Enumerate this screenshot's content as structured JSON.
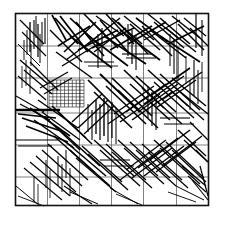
{
  "figure": {
    "type": "fracture-network-diagram",
    "width": 225,
    "height": 225,
    "background_color": "#ffffff"
  },
  "domain": {
    "name": "model-domain",
    "x0": 15.5,
    "y0": 13.5,
    "x1": 208.5,
    "y1": 205.5,
    "border_color": "#111111",
    "border_width": 1.6
  },
  "coarse_grid": {
    "name": "coarse-grid",
    "color": "#4a4a4a",
    "line_width": 0.7,
    "vertical_x": [
      47.5,
      79.5,
      111.5,
      143.5,
      176.5
    ],
    "horizontal_y": [
      46.0,
      78.0,
      113.0,
      145.0,
      177.0
    ],
    "columns": 6,
    "rows": 6
  },
  "refined_grid": {
    "name": "refined-subgrid",
    "color": "#1a1a1a",
    "line_width": 0.6,
    "x0": 49.0,
    "y0": 80.0,
    "x1": 84.0,
    "y1": 107.0,
    "cols": 9,
    "rows": 8
  },
  "fractures": {
    "name": "fracture-segments",
    "color": "#000000",
    "count": 196,
    "segments": [
      [
        30,
        22,
        30,
        52,
        1.3
      ],
      [
        34,
        20,
        34,
        49,
        1.1
      ],
      [
        38,
        24,
        38,
        57,
        1.2
      ],
      [
        42,
        22,
        42,
        46,
        1.0
      ],
      [
        27,
        30,
        27,
        55,
        1.0
      ],
      [
        45,
        18,
        45,
        44,
        1.1
      ],
      [
        24,
        40,
        24,
        60,
        0.9
      ],
      [
        36,
        16,
        36,
        38,
        1.0
      ],
      [
        40,
        34,
        40,
        63,
        1.0
      ],
      [
        31,
        44,
        31,
        66,
        0.9
      ],
      [
        52,
        15,
        66,
        40,
        1.6
      ],
      [
        55,
        18,
        78,
        44,
        1.7
      ],
      [
        60,
        16,
        88,
        52,
        1.8
      ],
      [
        50,
        30,
        82,
        62,
        1.5
      ],
      [
        58,
        46,
        90,
        26,
        1.6
      ],
      [
        64,
        52,
        96,
        22,
        1.5
      ],
      [
        70,
        18,
        100,
        46,
        1.7
      ],
      [
        76,
        22,
        104,
        56,
        1.6
      ],
      [
        66,
        60,
        98,
        36,
        1.4
      ],
      [
        84,
        14,
        110,
        40,
        1.5
      ],
      [
        90,
        20,
        118,
        48,
        1.6
      ],
      [
        96,
        16,
        124,
        36,
        1.4
      ],
      [
        88,
        44,
        120,
        18,
        1.5
      ],
      [
        94,
        52,
        126,
        28,
        1.4
      ],
      [
        100,
        20,
        128,
        52,
        1.6
      ],
      [
        106,
        14,
        134,
        44,
        1.5
      ],
      [
        112,
        18,
        142,
        44,
        1.6
      ],
      [
        118,
        22,
        148,
        54,
        1.5
      ],
      [
        124,
        16,
        154,
        40,
        1.4
      ],
      [
        130,
        24,
        160,
        50,
        1.5
      ],
      [
        136,
        18,
        168,
        42,
        1.6
      ],
      [
        142,
        26,
        172,
        56,
        1.5
      ],
      [
        148,
        14,
        178,
        38,
        1.4
      ],
      [
        154,
        22,
        184,
        48,
        1.5
      ],
      [
        160,
        18,
        190,
        44,
        1.6
      ],
      [
        166,
        28,
        196,
        52,
        1.4
      ],
      [
        172,
        16,
        200,
        38,
        1.5
      ],
      [
        178,
        24,
        204,
        50,
        1.4
      ],
      [
        184,
        18,
        206,
        36,
        1.3
      ],
      [
        190,
        28,
        208,
        46,
        1.2
      ],
      [
        196,
        14,
        196,
        48,
        1.2
      ],
      [
        202,
        20,
        202,
        56,
        1.1
      ],
      [
        160,
        36,
        200,
        62,
        1.7
      ],
      [
        168,
        44,
        204,
        26,
        1.6
      ],
      [
        150,
        30,
        186,
        58,
        1.5
      ],
      [
        144,
        40,
        180,
        20,
        1.4
      ],
      [
        120,
        30,
        160,
        60,
        1.8
      ],
      [
        128,
        44,
        166,
        22,
        1.6
      ],
      [
        104,
        36,
        146,
        64,
        1.7
      ],
      [
        110,
        50,
        152,
        26,
        1.5
      ],
      [
        86,
        34,
        128,
        66,
        1.6
      ],
      [
        92,
        48,
        134,
        28,
        1.4
      ],
      [
        70,
        36,
        112,
        68,
        1.7
      ],
      [
        78,
        50,
        118,
        30,
        1.5
      ],
      [
        56,
        52,
        92,
        78,
        1.5
      ],
      [
        62,
        66,
        98,
        44,
        1.4
      ],
      [
        20,
        60,
        48,
        84,
        1.4
      ],
      [
        24,
        70,
        52,
        94,
        1.3
      ],
      [
        18,
        76,
        46,
        100,
        1.2
      ],
      [
        30,
        62,
        58,
        90,
        1.3
      ],
      [
        16,
        96,
        44,
        112,
        1.1
      ],
      [
        20,
        104,
        50,
        120,
        1.2
      ],
      [
        15,
        110,
        60,
        110,
        2.6
      ],
      [
        18,
        114,
        56,
        118,
        1.4
      ],
      [
        22,
        118,
        64,
        132,
        1.5
      ],
      [
        26,
        126,
        68,
        142,
        1.4
      ],
      [
        30,
        108,
        70,
        136,
        1.6
      ],
      [
        34,
        120,
        74,
        148,
        1.5
      ],
      [
        38,
        100,
        78,
        128,
        1.4
      ],
      [
        42,
        112,
        80,
        140,
        1.3
      ],
      [
        88,
        80,
        126,
        118,
        1.7
      ],
      [
        94,
        92,
        132,
        128,
        1.6
      ],
      [
        100,
        74,
        140,
        112,
        1.8
      ],
      [
        106,
        86,
        146,
        124,
        1.6
      ],
      [
        112,
        78,
        152,
        116,
        1.7
      ],
      [
        118,
        90,
        158,
        128,
        1.5
      ],
      [
        124,
        70,
        164,
        108,
        1.6
      ],
      [
        130,
        84,
        170,
        120,
        1.5
      ],
      [
        136,
        76,
        176,
        112,
        1.6
      ],
      [
        142,
        88,
        182,
        124,
        1.4
      ],
      [
        148,
        70,
        188,
        106,
        1.5
      ],
      [
        154,
        82,
        194,
        118,
        1.4
      ],
      [
        160,
        74,
        200,
        110,
        1.5
      ],
      [
        166,
        86,
        204,
        120,
        1.3
      ],
      [
        172,
        78,
        206,
        106,
        1.4
      ],
      [
        178,
        90,
        208,
        114,
        1.2
      ],
      [
        150,
        96,
        190,
        68,
        1.6
      ],
      [
        156,
        108,
        196,
        80,
        1.5
      ],
      [
        162,
        100,
        202,
        72,
        1.4
      ],
      [
        144,
        104,
        184,
        76,
        1.5
      ],
      [
        138,
        112,
        178,
        84,
        1.4
      ],
      [
        132,
        120,
        172,
        92,
        1.5
      ],
      [
        126,
        112,
        166,
        84,
        1.4
      ],
      [
        120,
        122,
        160,
        94,
        1.3
      ],
      [
        114,
        114,
        154,
        86,
        1.4
      ],
      [
        108,
        124,
        148,
        96,
        1.3
      ],
      [
        15,
        140,
        58,
        140,
        1.2
      ],
      [
        18,
        146,
        52,
        146,
        1.0
      ],
      [
        96,
        100,
        96,
        134,
        1.3
      ],
      [
        100,
        104,
        100,
        140,
        1.2
      ],
      [
        104,
        98,
        104,
        136,
        1.4
      ],
      [
        108,
        106,
        108,
        142,
        1.1
      ],
      [
        112,
        102,
        112,
        138,
        1.2
      ],
      [
        116,
        108,
        116,
        144,
        1.0
      ],
      [
        92,
        110,
        92,
        140,
        1.1
      ],
      [
        88,
        104,
        88,
        132,
        1.0
      ],
      [
        60,
        130,
        100,
        166,
        1.6
      ],
      [
        66,
        142,
        106,
        176,
        1.5
      ],
      [
        54,
        136,
        94,
        172,
        1.5
      ],
      [
        48,
        144,
        88,
        180,
        1.4
      ],
      [
        42,
        150,
        82,
        186,
        1.3
      ],
      [
        36,
        156,
        76,
        192,
        1.2
      ],
      [
        30,
        162,
        70,
        196,
        1.2
      ],
      [
        24,
        168,
        62,
        200,
        1.1
      ],
      [
        70,
        150,
        110,
        186,
        1.4
      ],
      [
        76,
        158,
        116,
        192,
        1.3
      ],
      [
        82,
        146,
        122,
        182,
        1.4
      ],
      [
        88,
        154,
        128,
        190,
        1.3
      ],
      [
        94,
        140,
        134,
        176,
        1.4
      ],
      [
        100,
        150,
        140,
        186,
        1.3
      ],
      [
        106,
        144,
        146,
        180,
        1.3
      ],
      [
        112,
        152,
        152,
        188,
        1.2
      ],
      [
        118,
        140,
        158,
        176,
        1.3
      ],
      [
        124,
        148,
        164,
        184,
        1.2
      ],
      [
        130,
        142,
        170,
        178,
        1.3
      ],
      [
        136,
        150,
        176,
        186,
        1.2
      ],
      [
        142,
        144,
        182,
        180,
        1.3
      ],
      [
        148,
        152,
        188,
        188,
        1.2
      ],
      [
        154,
        140,
        194,
        176,
        1.4
      ],
      [
        160,
        148,
        200,
        184,
        1.3
      ],
      [
        166,
        142,
        204,
        178,
        1.2
      ],
      [
        172,
        150,
        206,
        182,
        1.1
      ],
      [
        150,
        160,
        190,
        130,
        1.5
      ],
      [
        156,
        172,
        196,
        142,
        1.4
      ],
      [
        162,
        166,
        202,
        136,
        1.3
      ],
      [
        144,
        176,
        184,
        146,
        1.4
      ],
      [
        138,
        168,
        178,
        138,
        1.3
      ],
      [
        132,
        178,
        172,
        148,
        1.3
      ],
      [
        126,
        170,
        166,
        140,
        1.2
      ],
      [
        120,
        180,
        160,
        150,
        1.2
      ],
      [
        178,
        130,
        206,
        156,
        1.4
      ],
      [
        184,
        140,
        208,
        162,
        1.3
      ],
      [
        190,
        122,
        208,
        140,
        1.2
      ],
      [
        196,
        150,
        208,
        162,
        1.1
      ],
      [
        182,
        166,
        206,
        186,
        1.3
      ],
      [
        188,
        176,
        206,
        192,
        1.1
      ],
      [
        176,
        186,
        204,
        200,
        1.0
      ],
      [
        168,
        192,
        196,
        202,
        0.9
      ],
      [
        194,
        60,
        194,
        96,
        1.1
      ],
      [
        198,
        70,
        198,
        104,
        1.0
      ],
      [
        202,
        62,
        202,
        92,
        0.9
      ],
      [
        190,
        80,
        190,
        110,
        1.0
      ],
      [
        186,
        56,
        186,
        84,
        0.9
      ],
      [
        58,
        156,
        58,
        186,
        1.0
      ],
      [
        62,
        164,
        62,
        192,
        0.9
      ],
      [
        66,
        150,
        66,
        178,
        1.0
      ],
      [
        70,
        168,
        70,
        196,
        0.9
      ],
      [
        46,
        160,
        46,
        188,
        0.9
      ],
      [
        50,
        170,
        50,
        198,
        0.8
      ],
      [
        34,
        176,
        34,
        202,
        0.9
      ],
      [
        38,
        184,
        38,
        204,
        0.8
      ],
      [
        26,
        60,
        26,
        86,
        0.9
      ],
      [
        22,
        66,
        22,
        88,
        0.8
      ],
      [
        30,
        70,
        30,
        94,
        0.9
      ],
      [
        122,
        54,
        152,
        54,
        1.1
      ],
      [
        126,
        58,
        156,
        58,
        1.0
      ],
      [
        84,
        62,
        114,
        62,
        1.0
      ],
      [
        88,
        66,
        118,
        66,
        0.9
      ],
      [
        160,
        118,
        190,
        118,
        1.1
      ],
      [
        164,
        124,
        194,
        124,
        1.0
      ],
      [
        100,
        160,
        130,
        160,
        1.0
      ],
      [
        104,
        166,
        134,
        166,
        0.9
      ],
      [
        52,
        106,
        86,
        138,
        1.5
      ],
      [
        58,
        112,
        92,
        144,
        1.4
      ],
      [
        46,
        118,
        80,
        150,
        1.3
      ],
      [
        132,
        30,
        132,
        64,
        1.2
      ],
      [
        136,
        36,
        136,
        70,
        1.1
      ],
      [
        128,
        24,
        128,
        56,
        1.1
      ],
      [
        102,
        28,
        102,
        62,
        1.2
      ],
      [
        98,
        34,
        98,
        68,
        1.1
      ],
      [
        152,
        92,
        152,
        126,
        1.2
      ],
      [
        156,
        98,
        156,
        130,
        1.1
      ],
      [
        148,
        86,
        148,
        118,
        1.1
      ],
      [
        174,
        40,
        174,
        74,
        1.1
      ],
      [
        178,
        48,
        178,
        80,
        1.0
      ],
      [
        170,
        34,
        170,
        66,
        1.0
      ],
      [
        20,
        20,
        44,
        44,
        1.2
      ],
      [
        22,
        32,
        46,
        56,
        1.1
      ],
      [
        18,
        44,
        40,
        66,
        1.0
      ],
      [
        200,
        166,
        208,
        196,
        1.2
      ],
      [
        192,
        180,
        208,
        200,
        1.1
      ],
      [
        16,
        186,
        40,
        206,
        1.0
      ],
      [
        18,
        196,
        44,
        206,
        0.9
      ],
      [
        64,
        186,
        92,
        204,
        1.1
      ],
      [
        70,
        192,
        98,
        204,
        1.0
      ],
      [
        110,
        188,
        138,
        204,
        1.0
      ],
      [
        116,
        194,
        142,
        205,
        0.9
      ],
      [
        40,
        88,
        68,
        72,
        1.2
      ],
      [
        44,
        94,
        72,
        78,
        1.1
      ],
      [
        78,
        128,
        108,
        100,
        1.4
      ],
      [
        84,
        134,
        114,
        106,
        1.3
      ],
      [
        72,
        122,
        102,
        94,
        1.3
      ]
    ]
  },
  "labels": {
    "alt_text": "Square model domain discretized by a 6 by 6 structured grid with a locally refined sub-grid block near the upper left, overlaid by a dense discrete fracture network of randomly oriented straight line segments."
  }
}
